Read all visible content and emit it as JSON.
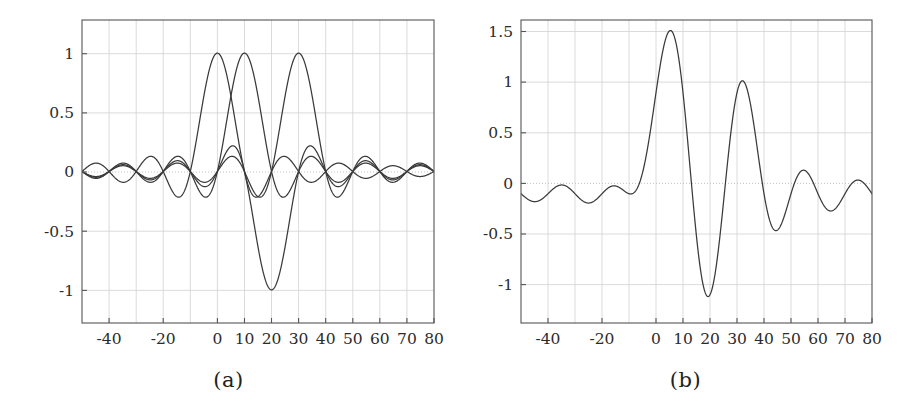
{
  "figure": {
    "panels": [
      {
        "id": "a",
        "caption": "(a)",
        "x_ticks": [
          "-40",
          "-20",
          "0",
          "10",
          "20",
          "30",
          "40",
          "50",
          "60",
          "70",
          "80"
        ],
        "x_tick_values": [
          -40,
          -20,
          0,
          10,
          20,
          30,
          40,
          50,
          60,
          70,
          80
        ],
        "y_ticks": [
          "1",
          "0.5",
          "0",
          "-0.5",
          "-1"
        ],
        "y_tick_values": [
          1,
          0.5,
          0,
          -0.5,
          -1
        ]
      },
      {
        "id": "b",
        "caption": "(b)",
        "x_ticks": [
          "-40",
          "-20",
          "0",
          "10",
          "20",
          "30",
          "40",
          "50",
          "60",
          "70",
          "80"
        ],
        "x_tick_values": [
          -40,
          -20,
          0,
          10,
          20,
          30,
          40,
          50,
          60,
          70,
          80
        ],
        "y_ticks": [
          "1.5",
          "1",
          "0.5",
          "0",
          "-0.5",
          "-1"
        ],
        "y_tick_values": [
          1.5,
          1,
          0.5,
          0,
          -0.5,
          -1
        ]
      }
    ]
  },
  "colors": {
    "curve": "#3a3a3a",
    "frame": "#555555",
    "grid": "#cfcfcf",
    "zero_grid": "#bdbdbd",
    "background": "#ffffff"
  },
  "chart_data": [
    {
      "type": "line",
      "panel": "a",
      "title": "",
      "subtitle": "",
      "caption": "(a)",
      "xlabel": "",
      "ylabel": "",
      "xlim": [
        -50,
        80
      ],
      "ylim": [
        -1.28,
        1.28
      ],
      "grid": true,
      "legend": "none",
      "xticks": [
        -40,
        -20,
        0,
        10,
        20,
        30,
        40,
        50,
        60,
        70,
        80
      ],
      "xticklabels": [
        "-40",
        "-20",
        "0",
        "10",
        "20",
        "30",
        "40",
        "50",
        "60",
        "70",
        "80"
      ],
      "yticks": [
        -1,
        -0.5,
        0,
        0.5,
        1
      ],
      "yticklabels": [
        "-1",
        "-0.5",
        "0",
        "0.5",
        "1"
      ],
      "description": "Three amplitude-1 sinc pulses sin(pi(t-d)/T)/(pi(t-d)/T) with T = 10, delays d = 0, 10 and 30 samples, overlaid on one axis.",
      "series": [
        {
          "name": "sinc pulse delay 0",
          "form": "sinc((t-0)/10)",
          "amplitude": 1.0,
          "delay": 0,
          "period": 10,
          "peak_x": 0,
          "peak_y": 1.0
        },
        {
          "name": "sinc pulse delay 10",
          "form": "sinc((t-10)/10)",
          "amplitude": 1.0,
          "delay": 10,
          "period": 10,
          "peak_x": 10,
          "peak_y": 1.0
        },
        {
          "name": "sinc pulse delay 30",
          "form": "sinc((t-30)/10)",
          "amplitude": 1.0,
          "delay": 30,
          "period": 10,
          "peak_x": 30,
          "peak_y": 1.0
        }
      ],
      "x": [
        -50,
        -48,
        -46,
        -44,
        -42,
        -40,
        -38,
        -36,
        -34,
        -32,
        -30,
        -28,
        -26,
        -24,
        -22,
        -20,
        -18,
        -16,
        -14,
        -12,
        -10,
        -8,
        -6,
        -4,
        -2,
        0,
        2,
        4,
        6,
        8,
        10,
        12,
        14,
        16,
        18,
        20,
        22,
        24,
        26,
        28,
        30,
        32,
        34,
        36,
        38,
        40,
        42,
        44,
        46,
        48,
        50,
        52,
        54,
        56,
        58,
        60,
        62,
        64,
        66,
        68,
        70,
        72,
        74,
        76,
        78,
        80
      ],
      "notes": "Zero crossings of each pulse occur at integer multiples of 10 away from its own delay; the main lobe of the third pulse is inverted in panel (a)? no - all three main lobes are positive at +1, the large negative excursion at t = 20 belongs to the superposition view in panel (b)."
    },
    {
      "type": "line",
      "panel": "b",
      "title": "",
      "subtitle": "",
      "caption": "(b)",
      "xlabel": "",
      "ylabel": "",
      "xlim": [
        -50,
        80
      ],
      "ylim": [
        -1.28,
        1.72
      ],
      "grid": true,
      "legend": "none",
      "xticks": [
        -40,
        -20,
        0,
        10,
        20,
        30,
        40,
        50,
        60,
        70,
        80
      ],
      "xticklabels": [
        "-40",
        "-20",
        "0",
        "10",
        "20",
        "30",
        "40",
        "50",
        "60",
        "70",
        "80"
      ],
      "yticks": [
        -1,
        -0.5,
        0,
        0.5,
        1,
        1.5
      ],
      "yticklabels": [
        "-1",
        "-0.5",
        "0",
        "0.5",
        "1",
        "1.5"
      ],
      "description": "Superposition of the three sinc pulses of panel (a) with symbol amplitudes +1, +1, -1, +1 giving one composite waveform.",
      "series": [
        {
          "name": "composite waveform",
          "form": "sinc((t-0)/10) + sinc((t-10)/10) - sinc((t-20)/10) + sinc((t-30)/10)",
          "key_points": [
            {
              "x": -23,
              "y": 0.04
            },
            {
              "x": -17,
              "y": -0.12
            },
            {
              "x": 5,
              "y": 1.34
            },
            {
              "x": 20,
              "y": -1.0
            },
            {
              "x": 31,
              "y": 1.07
            },
            {
              "x": 43,
              "y": -0.15
            },
            {
              "x": 52,
              "y": 0.03
            }
          ],
          "peak_y": 1.34,
          "min_y": -1.0
        }
      ]
    }
  ]
}
